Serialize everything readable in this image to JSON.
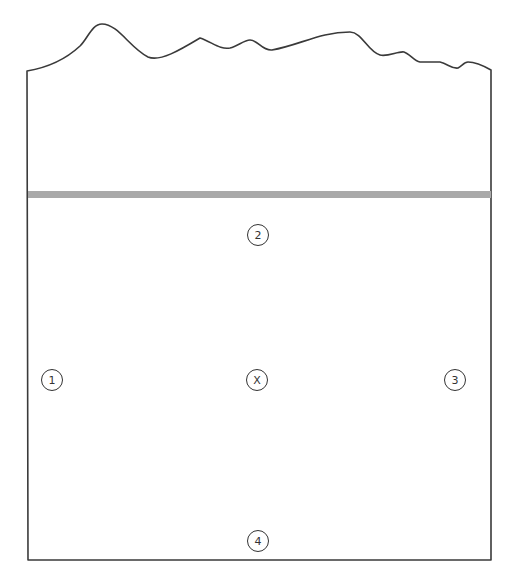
{
  "diagram": {
    "type": "site-layout",
    "colors": {
      "outline": "#3a3a3a",
      "band": "#a9a9a9",
      "background": "#ffffff"
    },
    "markers": [
      {
        "id": "marker-1",
        "label": "1",
        "x": 52,
        "y": 380
      },
      {
        "id": "marker-2",
        "label": "2",
        "x": 258,
        "y": 235
      },
      {
        "id": "marker-3",
        "label": "3",
        "x": 455,
        "y": 380
      },
      {
        "id": "marker-4",
        "label": "4",
        "x": 258,
        "y": 541
      },
      {
        "id": "marker-x",
        "label": "X",
        "x": 257,
        "y": 380
      }
    ]
  }
}
